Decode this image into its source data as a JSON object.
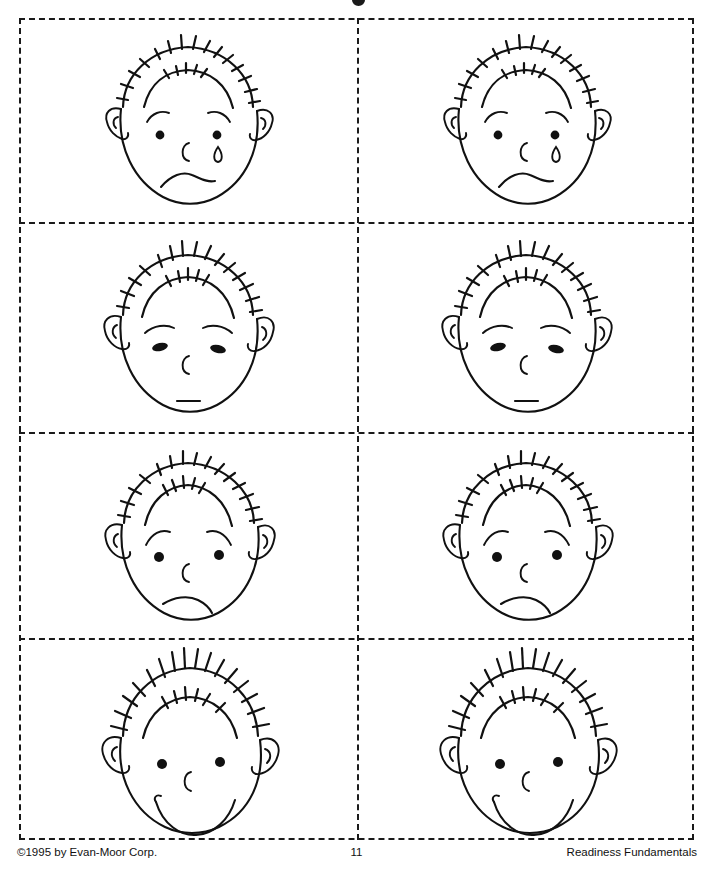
{
  "page": {
    "type": "worksheet",
    "layout": "4 rows x 2 columns of cut-apart cards",
    "ink_color": "#111111",
    "background_color": "#ffffff",
    "cut_line_style": "dashed"
  },
  "cards": [
    {
      "row": 1,
      "column": "left",
      "name": "sad-face-card",
      "expression": "sad",
      "features": {
        "eyes": "round dots",
        "eyebrows": "curved arcs",
        "nose": "C shape",
        "mouth": "downturned frown",
        "tear": "teardrop under right eye",
        "hair": "short sketchy dashes"
      }
    },
    {
      "row": 1,
      "column": "right",
      "name": "sad-face-card",
      "expression": "sad",
      "features": {
        "eyes": "round dots",
        "eyebrows": "curved arcs",
        "nose": "C shape",
        "mouth": "downturned frown",
        "tear": "teardrop under right eye",
        "hair": "short sketchy dashes"
      }
    },
    {
      "row": 2,
      "column": "left",
      "name": "sleepy-face-card",
      "expression": "sleepy",
      "features": {
        "eyes": "half-closed ovals",
        "eyebrows": "dashed arcs",
        "nose": "C shape",
        "mouth": "short straight dash",
        "tear": "none",
        "hair": "short sketchy dashes"
      }
    },
    {
      "row": 2,
      "column": "right",
      "name": "sleepy-face-card",
      "expression": "sleepy",
      "features": {
        "eyes": "half-closed ovals",
        "eyebrows": "dashed arcs",
        "nose": "C shape",
        "mouth": "short straight dash",
        "tear": "none",
        "hair": "short sketchy dashes"
      }
    },
    {
      "row": 3,
      "column": "left",
      "name": "angry-face-card",
      "expression": "angry",
      "features": {
        "eyes": "round dots",
        "eyebrows": "slanted inward",
        "nose": "C shape",
        "mouth": "crooked frown",
        "tear": "none",
        "hair": "short sketchy dashes"
      }
    },
    {
      "row": 3,
      "column": "right",
      "name": "angry-face-card",
      "expression": "angry",
      "features": {
        "eyes": "round dots",
        "eyebrows": "slanted inward",
        "nose": "C shape",
        "mouth": "crooked frown",
        "tear": "none",
        "hair": "short sketchy dashes"
      }
    },
    {
      "row": 4,
      "column": "left",
      "name": "happy-face-card",
      "expression": "happy",
      "features": {
        "eyes": "round dots",
        "eyebrows": "none",
        "nose": "C shape",
        "mouth": "wide smile",
        "tear": "none",
        "hair": "tall spiky dashes"
      }
    },
    {
      "row": 4,
      "column": "right",
      "name": "happy-face-card",
      "expression": "happy",
      "features": {
        "eyes": "round dots",
        "eyebrows": "none",
        "nose": "C shape",
        "mouth": "wide smile",
        "tear": "none",
        "hair": "tall spiky dashes"
      }
    }
  ],
  "footer": {
    "copyright": "©1995 by Evan-Moor Corp.",
    "page_number": "11",
    "series": "Readiness Fundamentals"
  }
}
